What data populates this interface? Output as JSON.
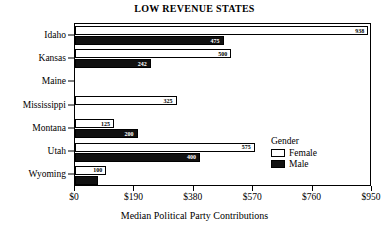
{
  "chart_data": {
    "type": "bar",
    "orientation": "horizontal",
    "title": "LOW REVENUE STATES",
    "xlabel": "Median Political Party Contributions",
    "ylabel": "",
    "categories": [
      "Idaho",
      "Kansas",
      "Maine",
      "Mississippi",
      "Montana",
      "Utah",
      "Wyoming"
    ],
    "series": [
      {
        "name": "Female",
        "color": "#ffffff",
        "values": [
          938,
          500,
          null,
          325,
          125,
          575,
          100
        ],
        "labels": [
          "938",
          "500",
          "",
          "325",
          "125",
          "575",
          "100"
        ]
      },
      {
        "name": "Male",
        "color": "#111111",
        "values": [
          475,
          242,
          null,
          null,
          200,
          400,
          75
        ],
        "labels": [
          "475",
          "242",
          "",
          "",
          "200",
          "400",
          ""
        ]
      }
    ],
    "xlim": [
      0,
      950
    ],
    "xticks": [
      0,
      190,
      380,
      570,
      760,
      950
    ],
    "xticklabels": [
      "$0",
      "$190",
      "$380",
      "$570",
      "$760",
      "$950"
    ],
    "grid": false,
    "legend": {
      "title": "Gender",
      "position": "inside-lower-right",
      "entries": [
        {
          "label": "Female",
          "swatch": "female"
        },
        {
          "label": "Male",
          "swatch": "male"
        }
      ]
    }
  }
}
